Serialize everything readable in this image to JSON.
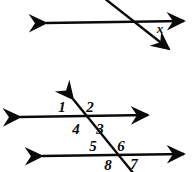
{
  "figure": {
    "stroke_color": "#0a0a0a",
    "background_color": "#ffffff",
    "stroke_width": 2.4
  },
  "top_diagram": {
    "name": "intersecting-lines-with-x",
    "horizontal_line": {
      "name": "horizontal-line",
      "arrow_start": "left-arrowhead",
      "arrow_end": "right-arrowhead",
      "x1": 42,
      "y1": 23,
      "x2": 188,
      "y2": 21
    },
    "transversal_line": {
      "name": "transversal-line",
      "arrow_start": "none",
      "arrow_end": "down-right-arrowhead",
      "x1": 104,
      "y1": -2,
      "x2": 172,
      "y2": 52
    },
    "intersection": {
      "x": 128,
      "y": 22
    },
    "labels": [
      {
        "id": "x",
        "text": "x",
        "x": 160,
        "y": 33,
        "name": "angle-label-x"
      }
    ]
  },
  "bottom_diagram": {
    "name": "parallel-lines-transversal",
    "upper_parallel_line": {
      "name": "upper-parallel-line",
      "arrow_start": "left-arrowhead",
      "arrow_end": "right-arrowhead",
      "x1": 16,
      "y1": 117,
      "x2": 152,
      "y2": 115
    },
    "lower_parallel_line": {
      "name": "lower-parallel-line",
      "arrow_start": "left-arrowhead",
      "arrow_end": "right-arrowhead",
      "x1": 38,
      "y1": 156,
      "x2": 188,
      "y2": 154
    },
    "transversal_line": {
      "name": "transversal-line",
      "arrow_start": "up-left-arrowhead",
      "arrow_end": "none",
      "x1": 70,
      "y1": 95,
      "x2": 134,
      "y2": 172
    },
    "upper_intersection": {
      "x": 84,
      "y": 116
    },
    "lower_intersection": {
      "x": 116,
      "y": 155
    },
    "labels": [
      {
        "id": "1",
        "text": "1",
        "x": 62,
        "y": 112,
        "name": "angle-label-1"
      },
      {
        "id": "2",
        "text": "2",
        "x": 90,
        "y": 112,
        "name": "angle-label-2"
      },
      {
        "id": "4",
        "text": "4",
        "x": 76,
        "y": 133,
        "name": "angle-label-4"
      },
      {
        "id": "3",
        "text": "3",
        "x": 100,
        "y": 133,
        "name": "angle-label-3"
      },
      {
        "id": "5",
        "text": "5",
        "x": 93,
        "y": 151,
        "name": "angle-label-5"
      },
      {
        "id": "6",
        "text": "6",
        "x": 121,
        "y": 151,
        "name": "angle-label-6"
      },
      {
        "id": "8",
        "text": "8",
        "x": 108,
        "y": 170,
        "name": "angle-label-8"
      },
      {
        "id": "7",
        "text": "7",
        "x": 134,
        "y": 169,
        "name": "angle-label-7"
      }
    ]
  }
}
